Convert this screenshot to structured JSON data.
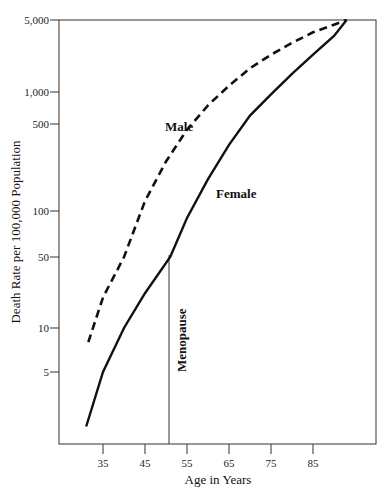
{
  "chart_data": {
    "type": "line",
    "title": "",
    "xlabel": "Age in Years",
    "ylabel": "Death Rate per 100,000 Population",
    "yscale": "log",
    "ylim": [
      2,
      5000
    ],
    "xlim": [
      27,
      98
    ],
    "grid": false,
    "x_ticks": [
      "35",
      "45",
      "55",
      "65",
      "75",
      "85"
    ],
    "y_ticks": [
      "5,000",
      "1,000",
      "500",
      "100",
      "50",
      "10",
      "5"
    ],
    "series": [
      {
        "name": "Male",
        "style": "dashed",
        "x": [
          31.5,
          35,
          40,
          45,
          50,
          55,
          60,
          65,
          70,
          75,
          80,
          85,
          90,
          93
        ],
        "y": [
          8,
          20,
          50,
          120,
          250,
          450,
          750,
          1150,
          1700,
          2300,
          3000,
          3800,
          4500,
          5000
        ]
      },
      {
        "name": "Female",
        "style": "solid",
        "x": [
          31,
          35,
          40,
          45,
          51,
          55,
          60,
          65,
          70,
          75,
          80,
          85,
          90,
          93
        ],
        "y": [
          2.5,
          5,
          10,
          22,
          50,
          90,
          180,
          340,
          600,
          950,
          1500,
          2300,
          3500,
          5000
        ]
      }
    ],
    "annotations": [
      {
        "text": "Male",
        "x": 51,
        "y": 320
      },
      {
        "text": "Female",
        "x": 66,
        "y": 140
      },
      {
        "text": "Menopause",
        "type": "vertical-line",
        "x": 51,
        "y_top": 50
      }
    ]
  }
}
